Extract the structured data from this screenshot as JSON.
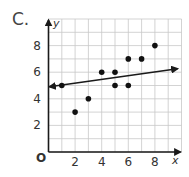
{
  "problem_label": "C.",
  "chart_data": {
    "type": "scatter",
    "title": "",
    "xlabel": "x",
    "ylabel": "y",
    "origin_label": "O",
    "xlim": [
      0,
      10
    ],
    "ylim": [
      0,
      10
    ],
    "grid": true,
    "x_ticks": [
      2,
      4,
      6,
      8
    ],
    "y_ticks": [
      2,
      4,
      6,
      8
    ],
    "points": [
      {
        "x": 1,
        "y": 5
      },
      {
        "x": 2,
        "y": 3
      },
      {
        "x": 3,
        "y": 4
      },
      {
        "x": 4,
        "y": 6
      },
      {
        "x": 5,
        "y": 6
      },
      {
        "x": 5,
        "y": 5
      },
      {
        "x": 6,
        "y": 7
      },
      {
        "x": 6,
        "y": 5
      },
      {
        "x": 7,
        "y": 7
      },
      {
        "x": 8,
        "y": 8
      }
    ],
    "trend_line": {
      "slope": 0.14,
      "intercept": 4.9,
      "x_start": 0,
      "x_end": 9.7,
      "arrows": "both"
    }
  },
  "colors": {
    "grid": "#c8c8c8",
    "axis": "#1a1a1a",
    "point": "#111111",
    "line": "#1a1a1a",
    "text": "#333333"
  }
}
